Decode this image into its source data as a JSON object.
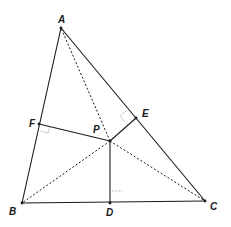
{
  "diagram": {
    "type": "geometry",
    "colors": {
      "line": "#1a1a1a",
      "right_angle_mark": "#9a9a9a",
      "background": "#ffffff"
    },
    "points": {
      "A": {
        "label": "A",
        "x": 61,
        "y": 28,
        "label_x": 58,
        "label_y": 23
      },
      "B": {
        "label": "B",
        "x": 22,
        "y": 203,
        "label_x": 9,
        "label_y": 215
      },
      "C": {
        "label": "C",
        "x": 205,
        "y": 201,
        "label_x": 210,
        "label_y": 210
      },
      "D": {
        "label": "D",
        "x": 110,
        "y": 203,
        "label_x": 106,
        "label_y": 216
      },
      "E": {
        "label": "E",
        "x": 136,
        "y": 118,
        "label_x": 142,
        "label_y": 117
      },
      "F": {
        "label": "F",
        "x": 39,
        "y": 124,
        "label_x": 29,
        "label_y": 127
      },
      "P": {
        "label": "P",
        "x": 110,
        "y": 141,
        "label_x": 93,
        "label_y": 133
      }
    },
    "solid_segments": [
      "AB",
      "BC",
      "CA",
      "PD",
      "PE",
      "PF"
    ],
    "dashed_segments": [
      "PA",
      "PB",
      "PC"
    ],
    "right_angles": [
      "F",
      "E",
      "D"
    ]
  }
}
